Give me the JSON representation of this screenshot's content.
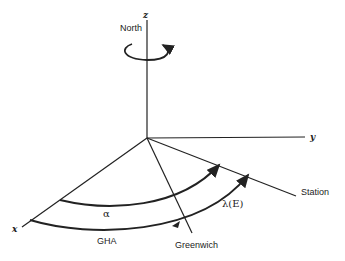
{
  "diagram": {
    "axes": {
      "x_label": "x",
      "y_label": "y",
      "z_label": "z"
    },
    "labels": {
      "north": "North",
      "station": "Station",
      "greenwich": "Greenwich",
      "alpha": "α",
      "lambda": "λ(E)",
      "gha": "GHA"
    },
    "colors": {
      "line": "#222222",
      "background": "#ffffff"
    }
  }
}
